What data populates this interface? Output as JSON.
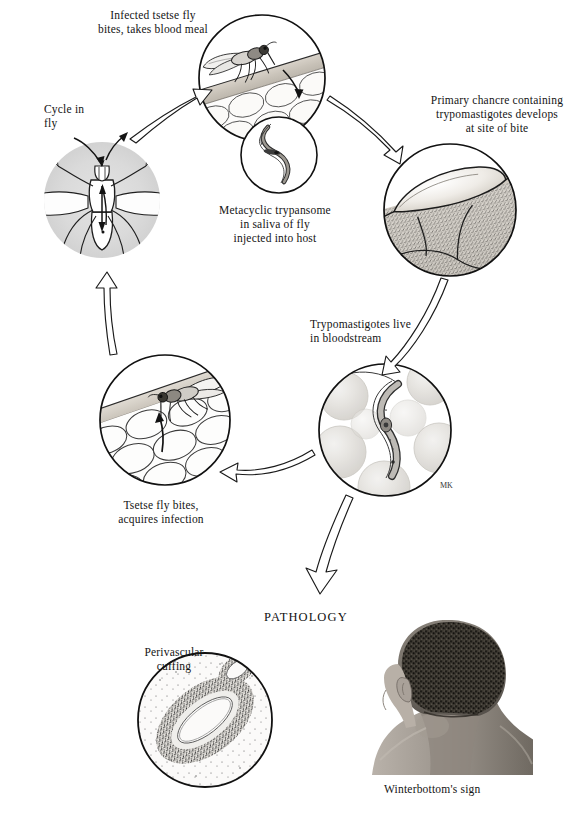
{
  "figure": {
    "pathology_heading": "PATHOLOGY",
    "artist_initials": "MK"
  },
  "labels": [
    {
      "id": "infected-fly-bite",
      "text": "Infected tsetse fly\nbites, takes blood meal",
      "x": 68,
      "y": 8,
      "width": 170,
      "align": "center"
    },
    {
      "id": "cycle-in-fly",
      "text": "Cycle in\nfly",
      "x": 44,
      "y": 102,
      "width": 70,
      "align": "left"
    },
    {
      "id": "primary-chancre",
      "text": "Primary chancre containing\ntrypomastigotes develops\nat site of bite",
      "x": 409,
      "y": 93,
      "width": 176,
      "align": "center"
    },
    {
      "id": "metacyclic-trypanosome",
      "text": "Metacyclic trypansome\nin saliva of fly\ninjected into host",
      "x": 195,
      "y": 203,
      "width": 160,
      "align": "center"
    },
    {
      "id": "trypomastigotes-bloodstream",
      "text": "Trypomastigotes live\nin bloodstream",
      "x": 310,
      "y": 317,
      "width": 150,
      "align": "left"
    },
    {
      "id": "tsetse-fly-bites-acquires",
      "text": "Tsetse fly bites,\nacquires infection",
      "x": 86,
      "y": 498,
      "width": 150,
      "align": "center"
    },
    {
      "id": "perivascular-cuffing",
      "text": "Perivascular\ncuffing",
      "x": 128,
      "y": 645,
      "width": 92,
      "align": "center"
    },
    {
      "id": "winterbottoms-sign",
      "text": "Winterbottom's sign",
      "x": 384,
      "y": 782,
      "width": 150,
      "align": "left"
    }
  ],
  "panels": [
    {
      "id": "fly-bites-host",
      "cx": 262,
      "cy": 78,
      "r": 63,
      "caption_ref": "infected-fly-bite"
    },
    {
      "id": "metacyclic-inset",
      "cx": 279,
      "cy": 155,
      "r": 38,
      "caption_ref": "metacyclic-trypanosome"
    },
    {
      "id": "cycle-in-fly-circle",
      "cx": 102,
      "cy": 200,
      "r": 58,
      "caption_ref": "cycle-in-fly"
    },
    {
      "id": "chancre-circle",
      "cx": 450,
      "cy": 210,
      "r": 66,
      "caption_ref": "primary-chancre"
    },
    {
      "id": "bloodstream-circle",
      "cx": 385,
      "cy": 430,
      "r": 66,
      "caption_ref": "trypomastigotes-bloodstream"
    },
    {
      "id": "fly-acquires-circle",
      "cx": 165,
      "cy": 420,
      "r": 65,
      "caption_ref": "tsetse-fly-bites-acquires"
    },
    {
      "id": "perivascular-circle",
      "cx": 205,
      "cy": 720,
      "r": 67,
      "caption_ref": "perivascular-cuffing"
    },
    {
      "id": "winterbottom-photo",
      "cx": 440,
      "cy": 705,
      "r": 0,
      "caption_ref": "winterbottoms-sign"
    }
  ],
  "pathology": {
    "heading": "PATHOLOGY",
    "heading_x": 264,
    "heading_y": 610
  },
  "colors": {
    "ink": "#111111",
    "outline": "#1a1a1a",
    "skin_fill": "#cfc9c0",
    "skin_fill_light": "#e6e2db",
    "cell_fill": "#f4f2ef",
    "gray_disc": "#dcdcdc",
    "rbc_fill": "#e2e0dd",
    "tissue_stipple": "#6b6b6b",
    "photo_dark": "#2a2a2a",
    "photo_mid": "#8a8a86",
    "paper": "#ffffff"
  }
}
